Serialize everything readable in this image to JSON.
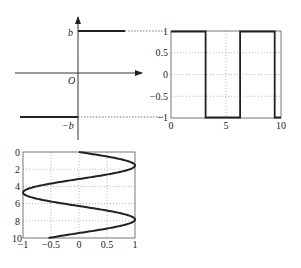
{
  "axes_diagram": {
    "origin_label": "O",
    "upper_level_label": "b",
    "lower_level_label": "−b",
    "line_color": "#222222"
  },
  "chart_data": [
    {
      "type": "line",
      "title": "",
      "description": "Square wave sign(sin t) on 0..10",
      "xlabel": "",
      "ylabel": "",
      "xlim": [
        0,
        10
      ],
      "ylim": [
        -1,
        1
      ],
      "xticks": [
        "0",
        "5",
        "10"
      ],
      "yticks": [
        "1",
        "0.5",
        "0",
        "−0.5",
        "−1"
      ],
      "grid": true,
      "series": [
        {
          "name": "square wave",
          "x": [
            0,
            3.14,
            3.14,
            6.28,
            6.28,
            9.42,
            9.42,
            10
          ],
          "y": [
            1,
            1,
            -1,
            -1,
            1,
            1,
            -1,
            -1
          ]
        }
      ]
    },
    {
      "type": "line",
      "title": "",
      "description": "Sine curve with vertical (downward) t axis",
      "xlabel": "",
      "ylabel": "",
      "xlim": [
        -1,
        1
      ],
      "ylim": [
        0,
        10
      ],
      "y_inverted": true,
      "xticks": [
        "−1",
        "−0.5",
        "0",
        "0.5",
        "1"
      ],
      "yticks": [
        "0",
        "2",
        "4",
        "6",
        "8",
        "10"
      ],
      "grid": true,
      "series": [
        {
          "name": "sin(t)",
          "t": [
            0,
            1.57,
            3.14,
            4.71,
            6.28,
            7.85,
            9.42,
            10
          ],
          "x": [
            0,
            1,
            0,
            -1,
            0,
            1,
            0,
            -0.54
          ]
        }
      ]
    }
  ]
}
